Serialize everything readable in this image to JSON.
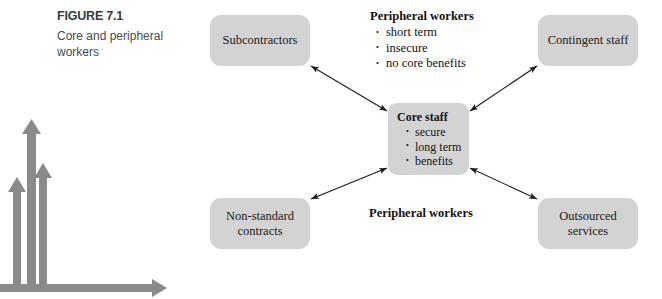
{
  "figure": {
    "number": "FIGURE 7.1",
    "caption": "Core and peripheral workers"
  },
  "diagram": {
    "center_node": {
      "title": "Core staff",
      "bullets": [
        "secure",
        "long term",
        "benefits"
      ]
    },
    "outer_nodes": [
      {
        "id": "subcontractors",
        "label": "Subcontractors",
        "position": "top-left"
      },
      {
        "id": "contingent-staff",
        "label": "Contingent staff",
        "position": "top-right"
      },
      {
        "id": "non-standard-contracts",
        "label": "Non-standard contracts",
        "position": "bottom-left"
      },
      {
        "id": "outsourced-services",
        "label": "Outsourced services",
        "position": "bottom-right"
      }
    ],
    "annotation_top": {
      "title": "Peripheral workers",
      "bullets": [
        "short term",
        "insecure",
        "no core benefits"
      ]
    },
    "annotation_bottom": {
      "title": "Peripheral workers"
    },
    "colors": {
      "box_fill": "#d3d3d3",
      "text": "#121212",
      "connector": "#1a1a1a",
      "corner_graphic": "#8a8a8a"
    }
  },
  "corner_graphic": {
    "description": "partial bar-arrow chart",
    "vertical_arrows": [
      {
        "x": 17,
        "top": 179,
        "height": 110
      },
      {
        "x": 31,
        "top": 120,
        "height": 169
      },
      {
        "x": 43,
        "top": 165,
        "height": 124
      }
    ],
    "horizontal_axis": {
      "y": 288,
      "from_x": 0,
      "to_x": 166
    }
  }
}
